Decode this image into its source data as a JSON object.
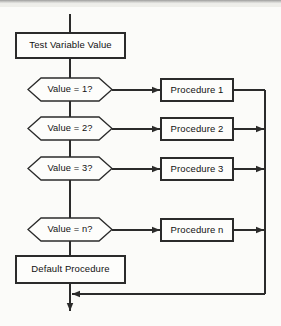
{
  "diagram": {
    "type": "flowchart",
    "background_color": "#fbfbf9",
    "line_color": "#2b2b2b",
    "text_color": "#111111",
    "fill_color": "#fdfdfb",
    "entry": {
      "name": "entry-line",
      "label": ""
    },
    "process_start": {
      "label": "Test Variable Value",
      "shape": "rectangle",
      "x": 16,
      "y": 33,
      "width": 109,
      "height": 25
    },
    "decisions": [
      {
        "label": "Value = 1?",
        "shape": "hexagon",
        "x": 28,
        "y": 78,
        "width": 84,
        "height": 23
      },
      {
        "label": "Value = 2?",
        "shape": "hexagon",
        "x": 28,
        "y": 117,
        "width": 84,
        "height": 23
      },
      {
        "label": "Value = 3?",
        "shape": "hexagon",
        "x": 28,
        "y": 157,
        "width": 84,
        "height": 23
      },
      {
        "label": "Value = n?",
        "shape": "hexagon",
        "x": 28,
        "y": 218,
        "width": 84,
        "height": 23
      }
    ],
    "procedures": [
      {
        "label": "Procedure 1",
        "shape": "rectangle",
        "x": 161,
        "y": 79,
        "width": 72,
        "height": 22
      },
      {
        "label": "Procedure 2",
        "shape": "rectangle",
        "x": 161,
        "y": 118,
        "width": 72,
        "height": 22
      },
      {
        "label": "Procedure 3",
        "shape": "rectangle",
        "x": 161,
        "y": 158,
        "width": 72,
        "height": 22
      },
      {
        "label": "Procedure n",
        "shape": "rectangle",
        "x": 161,
        "y": 219,
        "width": 72,
        "height": 22
      }
    ],
    "process_default": {
      "label": "Default Procedure",
      "shape": "rectangle",
      "x": 16,
      "y": 256,
      "width": 109,
      "height": 27
    },
    "connectors": {
      "main_axis_x": 70,
      "return_bus_x": 265,
      "merge_y": 294,
      "exit_arrow_y": 312,
      "ellipsis_note": "vertical gap between Value = 3? and Value = n? implies continuation"
    }
  }
}
